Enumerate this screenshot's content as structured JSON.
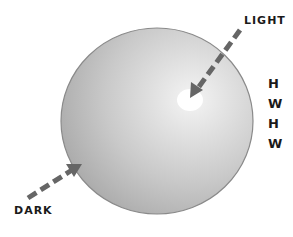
{
  "labels": {
    "light": "LIGHT",
    "dark": "DARK"
  },
  "side_text": {
    "lines": [
      "H",
      "W",
      "H",
      "W"
    ]
  },
  "colors": {
    "sphere_light": "#ececec",
    "sphere_mid": "#c8c8c8",
    "sphere_dark": "#a9a9a9",
    "highlight": "#ffffff",
    "arrow": "#666666",
    "text": "#1a1a1a"
  }
}
